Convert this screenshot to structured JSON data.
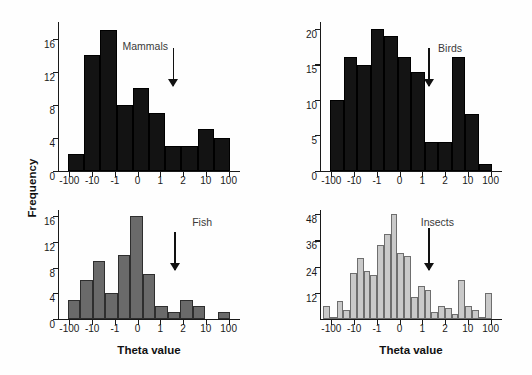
{
  "figure": {
    "y_axis_label": "Frequency",
    "x_axis_label": "Theta value"
  },
  "chart_data": [
    {
      "type": "bar",
      "title": "Mammals",
      "xlabel": "",
      "ylabel": "Frequency",
      "x_tick_labels": [
        "-100",
        "-10",
        "-1",
        "0",
        "1",
        "2",
        "10",
        "100"
      ],
      "x_tick_positions": [
        0,
        1,
        2,
        3,
        4,
        5,
        6,
        7
      ],
      "y_tick_labels": [
        "0",
        "4",
        "8",
        "12",
        "16"
      ],
      "y_tick_values": [
        0,
        4,
        8,
        12,
        16
      ],
      "ylim": [
        0,
        18
      ],
      "grid": false,
      "legend": "none",
      "bar_color": "#131313",
      "bar_edge_color": "#000000",
      "annotation": {
        "label": "arrow",
        "x_value": 4,
        "note": "downward arrow near theta = 1"
      },
      "bin_edges": [
        0.55,
        1.0,
        1.45,
        1.9,
        2.45,
        3.0,
        3.55,
        4.0,
        4.5,
        5.0,
        5.5,
        6.0
      ],
      "values": [
        2,
        14,
        17,
        8,
        10,
        7,
        3,
        3,
        5,
        4
      ]
    },
    {
      "type": "bar",
      "title": "Birds",
      "xlabel": "",
      "ylabel": "Frequency",
      "x_tick_labels": [
        "-100",
        "-10",
        "-1",
        "0",
        "1",
        "2",
        "10",
        "100"
      ],
      "x_tick_positions": [
        0,
        1,
        2,
        3,
        4,
        5,
        6,
        7
      ],
      "y_tick_labels": [
        "0",
        "5",
        "10",
        "15",
        "20"
      ],
      "y_tick_values": [
        0,
        5,
        10,
        15,
        20
      ],
      "ylim": [
        0,
        21
      ],
      "grid": false,
      "legend": "none",
      "bar_color": "#141414",
      "bar_edge_color": "#000000",
      "annotation": {
        "label": "arrow",
        "x_value": 4,
        "note": "downward arrow near theta = 1"
      },
      "values": [
        10,
        16,
        15,
        20,
        19,
        16,
        14,
        4,
        4,
        16,
        8,
        1
      ]
    },
    {
      "type": "bar",
      "title": "Fish",
      "xlabel": "Theta value",
      "ylabel": "Frequency",
      "x_tick_labels": [
        "-100",
        "-10",
        "-1",
        "0",
        "1",
        "2",
        "10",
        "100"
      ],
      "x_tick_positions": [
        0,
        1,
        2,
        3,
        4,
        5,
        6,
        7
      ],
      "y_tick_labels": [
        "0",
        "4",
        "8",
        "12",
        "16"
      ],
      "y_tick_values": [
        0,
        4,
        8,
        12,
        16
      ],
      "ylim": [
        0,
        17
      ],
      "grid": false,
      "legend": "none",
      "bar_color": "#6a6a6a",
      "bar_edge_color": "#2e2e2e",
      "annotation": {
        "label": "arrow",
        "x_value": 4,
        "note": "downward arrow near theta = 1"
      },
      "values": [
        3,
        6,
        9,
        4,
        10,
        16,
        7,
        2,
        1,
        3,
        2,
        0,
        1
      ]
    },
    {
      "type": "bar",
      "title": "Insects",
      "xlabel": "Theta value",
      "ylabel": "Frequency",
      "x_tick_labels": [
        "-100",
        "-10",
        "-1",
        "0",
        "1",
        "2",
        "10",
        "100"
      ],
      "x_tick_positions": [
        0,
        1,
        2,
        3,
        4,
        5,
        6,
        7
      ],
      "y_tick_labels": [
        "12",
        "24",
        "36",
        "48"
      ],
      "y_tick_values": [
        12,
        24,
        36,
        48
      ],
      "ylim": [
        0,
        50
      ],
      "grid": false,
      "legend": "none",
      "bar_color": "#c9c9c9",
      "bar_edge_color": "#6e6e6e",
      "annotation": {
        "label": "arrow",
        "x_value": 4,
        "note": "downward arrow near theta = 1"
      },
      "values": [
        6,
        1,
        8,
        4,
        21,
        28,
        22,
        20,
        34,
        39,
        48,
        30,
        29,
        10,
        15,
        13,
        3,
        6,
        5,
        2,
        18,
        6,
        4,
        1,
        12,
        0
      ]
    }
  ]
}
